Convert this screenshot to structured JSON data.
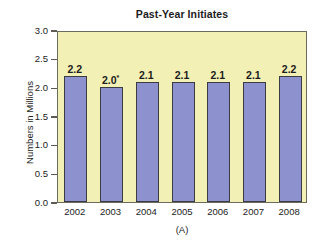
{
  "chart_data": {
    "type": "bar",
    "title": "Past-Year Initiates",
    "subtitle": "",
    "xlabel": "(A)",
    "ylabel": "Numbers in Millions",
    "categories": [
      "2002",
      "2003",
      "2004",
      "2005",
      "2006",
      "2007",
      "2008"
    ],
    "values": [
      2.2,
      2.0,
      2.1,
      2.1,
      2.1,
      2.1,
      2.2
    ],
    "data_labels": [
      "2.2",
      "2.0",
      "2.1",
      "2.1",
      "2.1",
      "2.1",
      "2.2"
    ],
    "data_label_markers": [
      "",
      "*",
      "",
      "",
      "",
      "",
      ""
    ],
    "ylim": [
      0.0,
      3.0
    ],
    "ytick_labels": [
      "3.0",
      "2.5",
      "2.0",
      "1.5",
      "1.0",
      "0.5",
      "0.0"
    ],
    "ytick_values": [
      3.0,
      2.5,
      2.0,
      1.5,
      1.0,
      0.5,
      0.0
    ],
    "grid": false,
    "legend": null,
    "legend_position": "none",
    "annotations": [
      "* Difference between this estimate and the 2008 estimate is statistically significant"
    ],
    "colors": {
      "bar_fill": "#8d92cf",
      "bar_stroke": "#3b3b44",
      "plot_background": "#f2f0b4",
      "plot_border": "#6b6b5e",
      "page_background": "#ffffff",
      "text": "#1c1c1c"
    }
  }
}
